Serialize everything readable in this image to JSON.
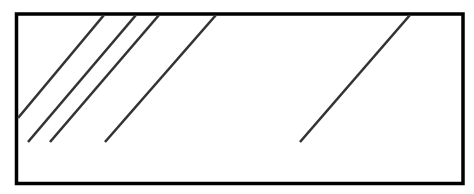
{
  "diagram": {
    "line_count": 5,
    "colors": {
      "background": "#ffffff",
      "frame": "#000000",
      "lines": "#333333"
    }
  }
}
